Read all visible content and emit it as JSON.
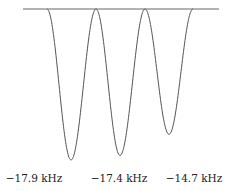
{
  "chart_data": {
    "type": "line",
    "title": "",
    "xlabel": "",
    "ylabel": "",
    "grid": false,
    "legend": null,
    "baseline_y": 0,
    "peaks": [
      {
        "label": "−17.9 kHz",
        "center_px": 71,
        "depth": -1.0
      },
      {
        "label": "−17.4 kHz",
        "center_px": 120,
        "depth": -0.97
      },
      {
        "label": "−14.7 kHz",
        "center_px": 169,
        "depth": -0.83
      }
    ],
    "tick_labels": [
      "−17.9 kHz",
      "−17.4 kHz",
      "−14.7 kHz"
    ],
    "colors": {
      "line": "#555555",
      "text": "#222222"
    }
  }
}
